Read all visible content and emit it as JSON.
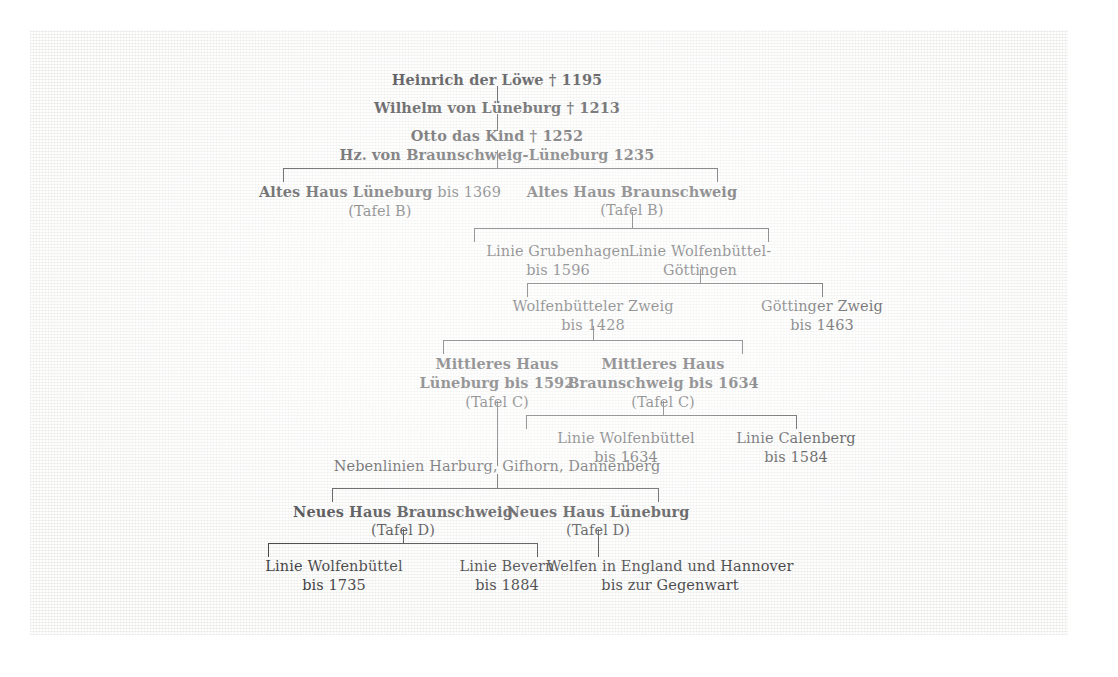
{
  "diagram": {
    "title_kind": "welf-dynasty-genealogy-table",
    "nodes": {
      "heinrich": {
        "main": "Heinrich der Löwe † 1195"
      },
      "wilhelm": {
        "main": "Wilhelm von Lüneburg † 1213"
      },
      "otto_line1": {
        "main": "Otto das Kind † 1252"
      },
      "otto_line2": {
        "main": "Hz. von Braunschweig-Lüneburg 1235"
      },
      "altes_haus_lueneburg": {
        "bold": "Altes Haus Lüneburg",
        "regular": " bis 1369",
        "sub": "(Tafel B)"
      },
      "altes_haus_braunschweig": {
        "bold": "Altes Haus Braunschweig",
        "regular": "",
        "sub": "(Tafel B)"
      },
      "linie_grubenhagen": {
        "line1": "Linie Grubenhagen",
        "line2": "bis 1596"
      },
      "linie_wolfenbuettel_goettingen": {
        "line1": "Linie Wolfenbüttel-",
        "line2": "Göttingen"
      },
      "wolfenbuetteler_zweig": {
        "line1": "Wolfenbütteler Zweig",
        "line2": "bis 1428"
      },
      "goettinger_zweig": {
        "line1": "Göttinger Zweig",
        "line2": "bis 1463"
      },
      "mittleres_haus_lueneburg": {
        "line1": "Mittleres Haus",
        "line2": "Lüneburg bis 1592",
        "sub": "(Tafel C)"
      },
      "mittleres_haus_braunschweig": {
        "line1": "Mittleres Haus",
        "line2": "Braunschweig bis 1634",
        "sub": "(Tafel C)"
      },
      "linie_wolfenbuettel_1634": {
        "line1": "Linie Wolfenbüttel",
        "line2": "bis 1634"
      },
      "linie_calenberg": {
        "line1": "Linie Calenberg",
        "line2": "bis 1584"
      },
      "nebenlinien": {
        "main": "Nebenlinien Harburg, Gifhorn, Dannenberg"
      },
      "neues_haus_braunschweig": {
        "bold": "Neues Haus Braunschweig",
        "sub": "(Tafel D)"
      },
      "neues_haus_lueneburg": {
        "bold": "Neues Haus Lüneburg",
        "sub": "(Tafel D)"
      },
      "linie_wolfenbuettel_1735": {
        "line1": "Linie Wolfenbüttel",
        "line2": "bis 1735"
      },
      "linie_bevern": {
        "line1": "Linie Bevern",
        "line2": "bis 1884"
      },
      "welfen_england_hannover": {
        "line1": "Welfen in England und Hannover",
        "line2": "bis zur Gegenwart"
      }
    },
    "colors": {
      "text": "#17171a",
      "line": "#1b1b1e",
      "paper": "#f7f7f5",
      "page": "#ffffff"
    }
  }
}
